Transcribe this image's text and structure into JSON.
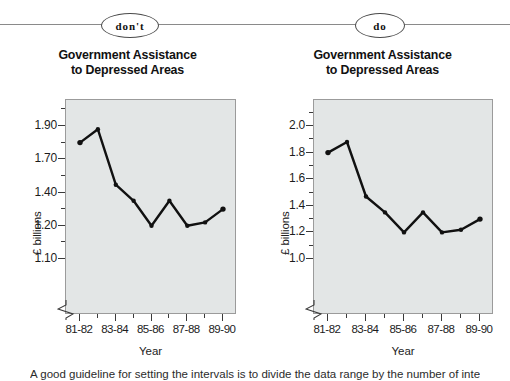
{
  "annotations": {
    "dont_label": "don't",
    "do_label": "do"
  },
  "caption": "A good guideline for setting the intervals is to divide the data range by the number of intervals",
  "panels": [
    {
      "key": "dont",
      "badge": "don't",
      "title_line1": "Government Assistance",
      "title_line2": "to Depressed Areas"
    },
    {
      "key": "do",
      "badge": "do",
      "title_line1": "Government Assistance",
      "title_line2": "to Depressed Areas"
    }
  ],
  "chart_data": [
    {
      "type": "line",
      "panel": "don't",
      "title": "Government Assistance to Depressed Areas",
      "xlabel": "Year",
      "ylabel": "£ billions",
      "x": [
        "81-82",
        "82-83",
        "83-84",
        "84-85",
        "85-86",
        "86-87",
        "87-88",
        "88-89",
        "89-90"
      ],
      "values": [
        1.8,
        1.88,
        1.47,
        1.35,
        1.2,
        1.35,
        1.2,
        1.22,
        1.3
      ],
      "xtick_labels": [
        "81-82",
        "83-84",
        "85-86",
        "87-88",
        "89-90"
      ],
      "ytick_labels": [
        "1.90",
        "1.70",
        "1.40",
        "1.20",
        "1.10"
      ],
      "ytick_values": [
        1.9,
        1.7,
        1.4,
        1.2,
        1.1
      ],
      "ytick_spacing": "equal-pixel-unequal-value",
      "ylim": [
        1.1,
        1.9
      ],
      "grid": false,
      "legend": "none",
      "axis_break": true,
      "note": "y-axis intervals are unequal in value but equally spaced"
    },
    {
      "type": "line",
      "panel": "do",
      "title": "Government Assistance to Depressed Areas",
      "xlabel": "Year",
      "ylabel": "£ billions",
      "x": [
        "81-82",
        "82-83",
        "83-84",
        "84-85",
        "85-86",
        "86-87",
        "87-88",
        "88-89",
        "89-90"
      ],
      "values": [
        1.8,
        1.88,
        1.47,
        1.35,
        1.2,
        1.35,
        1.2,
        1.22,
        1.3
      ],
      "xtick_labels": [
        "81-82",
        "83-84",
        "85-86",
        "87-88",
        "89-90"
      ],
      "ytick_labels": [
        "2.0",
        "1.8",
        "1.6",
        "1.4",
        "1.2",
        "1.0"
      ],
      "ytick_values": [
        2.0,
        1.8,
        1.6,
        1.4,
        1.2,
        1.0
      ],
      "ytick_spacing": "linear",
      "ylim": [
        1.0,
        2.0
      ],
      "grid": false,
      "legend": "none",
      "axis_break": true,
      "note": "y-axis intervals are equal in value and equally spaced"
    }
  ],
  "style": {
    "plot_background": "#e3e6e6",
    "plot_border": "#9b9b9b",
    "series_color": "#111111",
    "rule_color": "#8a8a8a"
  }
}
